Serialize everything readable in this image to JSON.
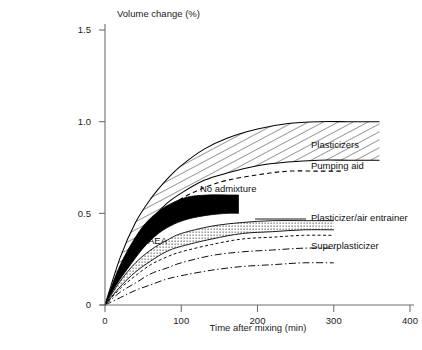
{
  "chart_data": {
    "type": "line",
    "title": "",
    "xlabel": "Time after mixing (min)",
    "ylabel": "Volume change (%)",
    "xlim": [
      0,
      400
    ],
    "ylim": [
      0,
      1.5
    ],
    "xticks": [
      "0",
      "100",
      "200",
      "300",
      "400"
    ],
    "yticks": [
      "0",
      "0.5",
      "1.0",
      "1.5"
    ],
    "grid": false,
    "legend_position": "inline-right",
    "series": [
      {
        "name": "Plasticizers",
        "style": "hatched-band",
        "label": "Plasticizers",
        "x": [
          0,
          20,
          40,
          60,
          80,
          100,
          130,
          160,
          200,
          240,
          280,
          320,
          360
        ],
        "upper": [
          0.0,
          0.26,
          0.45,
          0.58,
          0.68,
          0.76,
          0.85,
          0.91,
          0.96,
          0.99,
          1.0,
          1.0,
          1.0
        ],
        "lower": [
          0.0,
          0.2,
          0.35,
          0.46,
          0.55,
          0.61,
          0.68,
          0.72,
          0.76,
          0.78,
          0.79,
          0.79,
          0.79
        ]
      },
      {
        "name": "Pumping aid",
        "style": "dashed-line",
        "label": "Pumping aid",
        "x": [
          0,
          20,
          40,
          60,
          80,
          100,
          130,
          160,
          200,
          240,
          280,
          310
        ],
        "values": [
          0.0,
          0.19,
          0.33,
          0.44,
          0.52,
          0.58,
          0.64,
          0.68,
          0.71,
          0.73,
          0.73,
          0.73
        ]
      },
      {
        "name": "No admixture",
        "style": "solid-black-band",
        "label": "No admixture",
        "x": [
          0,
          15,
          30,
          50,
          70,
          90,
          110,
          135,
          160,
          175
        ],
        "upper": [
          0.0,
          0.17,
          0.3,
          0.43,
          0.51,
          0.56,
          0.59,
          0.6,
          0.6,
          0.6
        ],
        "lower": [
          0.0,
          0.11,
          0.2,
          0.31,
          0.39,
          0.44,
          0.47,
          0.49,
          0.5,
          0.5
        ]
      },
      {
        "name": "Plasticizer/air entrainer",
        "style": "stippled-band",
        "label": "Plasticizer/air entrainer",
        "x": [
          0,
          20,
          40,
          60,
          80,
          100,
          140,
          180,
          220,
          260,
          300
        ],
        "upper": [
          0.0,
          0.13,
          0.23,
          0.3,
          0.35,
          0.39,
          0.43,
          0.45,
          0.46,
          0.46,
          0.46
        ],
        "lower": [
          0.0,
          0.1,
          0.18,
          0.24,
          0.29,
          0.32,
          0.36,
          0.39,
          0.4,
          0.41,
          0.41
        ]
      },
      {
        "name": "AEA",
        "style": "fine-dashed-line",
        "label": "AEA",
        "x": [
          0,
          20,
          40,
          60,
          80,
          100,
          140,
          180,
          220,
          260,
          300
        ],
        "values": [
          0.0,
          0.09,
          0.16,
          0.22,
          0.26,
          0.29,
          0.33,
          0.36,
          0.37,
          0.38,
          0.38
        ]
      },
      {
        "name": "Superplasticizer",
        "style": "dashdot-band",
        "label": "Superplasticizer",
        "x": [
          0,
          20,
          40,
          60,
          80,
          100,
          140,
          180,
          220,
          260,
          300
        ],
        "upper": [
          0.0,
          0.07,
          0.12,
          0.17,
          0.2,
          0.23,
          0.27,
          0.29,
          0.3,
          0.31,
          0.31
        ],
        "lower": [
          0.0,
          0.04,
          0.08,
          0.11,
          0.14,
          0.16,
          0.19,
          0.21,
          0.22,
          0.23,
          0.23
        ]
      }
    ],
    "annotations": [
      {
        "text": "Plasticizers",
        "x": 400,
        "y": 0.87
      },
      {
        "text": "Pumping aid",
        "x": 400,
        "y": 0.755
      },
      {
        "text": "No admixture",
        "x": 200,
        "y": 0.555
      },
      {
        "text": "Plasticizer/air entrainer",
        "x": 400,
        "y": 0.455
      },
      {
        "text": "AEA",
        "x": 85,
        "y": 0.325
      },
      {
        "text": "Superplasticizer",
        "x": 400,
        "y": 0.315
      }
    ]
  },
  "axes": {
    "y_title": "Volume change (%)",
    "x_title": "Time after mixing (min)",
    "y_tick_labels": [
      "1.5",
      "1.0",
      "0.5",
      "0"
    ],
    "x_tick_labels": [
      "0",
      "100",
      "200",
      "300",
      "400"
    ]
  },
  "labels": {
    "plasticizers": "Plasticizers",
    "pumping_aid": "Pumping aid",
    "no_admixture": "No admixture",
    "plasticizer_air_entrainer": "Plasticizer/air entrainer",
    "aea": "AEA",
    "superplasticizer": "Superplasticizer"
  },
  "colors": {
    "axis": "#6f6f6f",
    "curve": "#000000",
    "band_fill": "#000000",
    "text": "#1a1a1a",
    "background": "#ffffff"
  }
}
